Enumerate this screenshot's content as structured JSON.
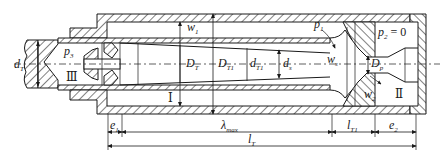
{
  "diagram": {
    "type": "jet-pump-cross-section",
    "labels": {
      "dT": {
        "main": "d",
        "sub": "T"
      },
      "p3": {
        "main": "p",
        "sub": "3"
      },
      "zone3": "Ⅲ",
      "w1": {
        "main": "w",
        "sub": "1"
      },
      "DT": {
        "main": "D",
        "sub": "T"
      },
      "DT1": {
        "main": "D",
        "sub": "T1"
      },
      "dT1": {
        "main": "d",
        "sub": "T1"
      },
      "ds": {
        "main": "d",
        "sub": "s"
      },
      "zone1": "Ⅰ",
      "p1": {
        "main": "p",
        "sub": "1"
      },
      "ws": {
        "main": "w",
        "sub": "s"
      },
      "p2": {
        "main": "p",
        "sub": "2",
        "suffix": " = 0"
      },
      "Dp": {
        "main": "D",
        "sub": "p"
      },
      "w2": {
        "main": "w",
        "sub": "2"
      },
      "zone2": "Ⅱ"
    },
    "dimensions": {
      "e1": {
        "main": "e",
        "sub": "1"
      },
      "lambda_max": {
        "main": "λ",
        "sub": "max"
      },
      "lT1": {
        "main": "l",
        "sub": "T1"
      },
      "e2": {
        "main": "e",
        "sub": "2"
      },
      "lT": {
        "main": "l",
        "sub": "T"
      }
    }
  }
}
